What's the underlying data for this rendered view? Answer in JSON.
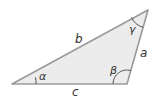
{
  "diagram": {
    "type": "triangle",
    "fill_color": "#ececec",
    "stroke_color": "#9a9a9a",
    "arc_color": "#555555",
    "text_color": "#333333",
    "sides": {
      "a": "a",
      "b": "b",
      "c": "c"
    },
    "angles": {
      "alpha": "α",
      "beta": "β",
      "gamma": "γ"
    }
  }
}
